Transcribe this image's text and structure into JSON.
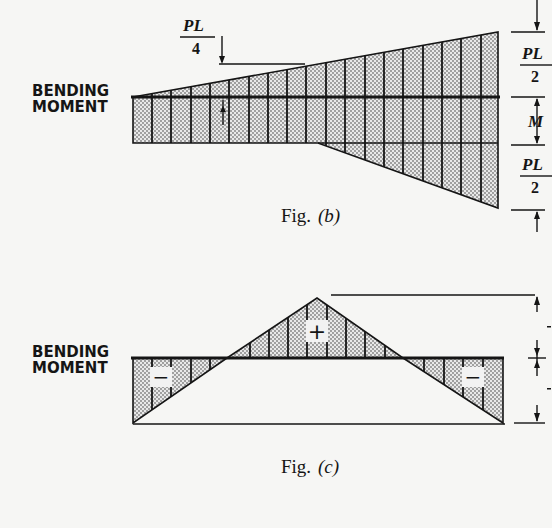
{
  "colors": {
    "background": "#f6f6f4",
    "ink": "#151515",
    "stipple": "#8a8a8a",
    "fill": "#e6e6e6"
  },
  "fig_b": {
    "caption_prefix": "Fig.",
    "caption_letter": "(b)",
    "axis_label_line1": "BENDING",
    "axis_label_line2": "MOMENT",
    "top_left_annotation": {
      "numerator": "PL",
      "denominator": "4"
    },
    "right_dims": [
      {
        "numerator": "PL",
        "denominator": "2"
      },
      {
        "single": "M"
      },
      {
        "numerator": "PL",
        "denominator": "2"
      }
    ]
  },
  "fig_c": {
    "caption_prefix": "Fig.",
    "caption_letter": "(c)",
    "axis_label_line1": "BENDING",
    "axis_label_line2": "MOMENT",
    "sign_left": "−",
    "sign_center": "+",
    "sign_right": "−"
  }
}
